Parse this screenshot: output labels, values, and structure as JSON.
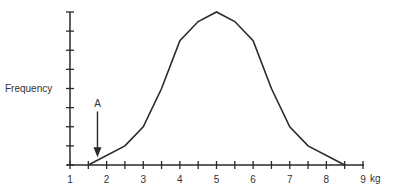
{
  "chart_data": {
    "type": "line",
    "title": "",
    "xlabel": "kg",
    "ylabel": "Frequency",
    "xlim": [
      1,
      9
    ],
    "ylim": [
      0,
      8
    ],
    "x_ticks": [
      "1",
      "2",
      "3",
      "4",
      "5",
      "6",
      "7",
      "8",
      "9"
    ],
    "y_ticks_count": 8,
    "y_tick_labels": [],
    "grid": false,
    "legend": null,
    "series": [
      {
        "name": "Frequency distribution",
        "x": [
          1.5,
          2.5,
          3,
          3.5,
          4,
          4.5,
          5,
          5.5,
          6,
          6.5,
          7,
          7.5,
          8.5
        ],
        "y": [
          0,
          1,
          2,
          4,
          6.5,
          7.5,
          8,
          7.5,
          6.5,
          4,
          2,
          1,
          0
        ]
      }
    ],
    "annotations": [
      {
        "label": "A",
        "type": "arrow-down",
        "x": 1.75,
        "y_from": 2.8,
        "y_to": 0.4
      }
    ]
  },
  "labels": {
    "ylabel": "Frequency",
    "xunit": "kg",
    "annotation": "A"
  },
  "colors": {
    "line": "#2a2a2a",
    "text": "#333333",
    "background": "#ffffff"
  }
}
